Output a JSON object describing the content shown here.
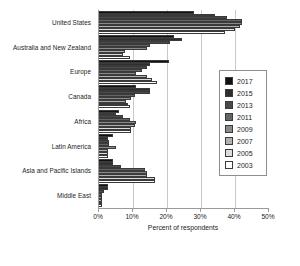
{
  "chart_data": {
    "type": "bar",
    "orientation": "horizontal",
    "title": "",
    "xlabel": "Percent of respondents",
    "ylabel": "",
    "xlim": [
      0,
      50
    ],
    "xticks": [
      "0%",
      "10%",
      "20%",
      "30%",
      "40%",
      "50%"
    ],
    "xtick_values": [
      0,
      10,
      20,
      30,
      40,
      50
    ],
    "grid": true,
    "legend_position": "right-inside",
    "categories": [
      "United States",
      "Australia and New Zealand",
      "Europe",
      "Canada",
      "Africa",
      "Latin America",
      "Asia and Pacific Islands",
      "Middle East"
    ],
    "series": [
      {
        "name": "2017",
        "color": "#111111",
        "values": [
          28,
          22,
          20.5,
          11,
          6,
          4,
          4,
          2.5
        ]
      },
      {
        "name": "2015",
        "color": "#2e2e2e",
        "values": [
          34,
          24.5,
          15,
          15,
          5,
          2.5,
          4,
          2.5
        ]
      },
      {
        "name": "2013",
        "color": "#494949",
        "values": [
          37.5,
          21,
          14,
          15,
          7,
          3,
          6.5,
          1.5
        ]
      },
      {
        "name": "2011",
        "color": "#646464",
        "values": [
          42,
          15,
          12.5,
          10.5,
          9,
          3,
          13.5,
          1
        ]
      },
      {
        "name": "2009",
        "color": "#8a8a8a",
        "values": [
          42,
          14,
          11,
          9.5,
          11,
          5,
          14,
          1
        ]
      },
      {
        "name": "2007",
        "color": "#b0b0b0",
        "values": [
          41.5,
          7.5,
          14,
          8,
          10.5,
          2.5,
          14,
          1
        ]
      },
      {
        "name": "2005",
        "color": "#dcdcdc",
        "values": [
          40,
          7,
          15.5,
          8.5,
          9.5,
          2.5,
          16.5,
          1
        ]
      },
      {
        "name": "2003",
        "color": "#ffffff",
        "values": [
          37,
          9,
          17,
          9,
          9.5,
          2.5,
          16.5,
          1
        ]
      }
    ]
  },
  "legend": {
    "items": [
      {
        "label": "2017"
      },
      {
        "label": "2015"
      },
      {
        "label": "2013"
      },
      {
        "label": "2011"
      },
      {
        "label": "2009"
      },
      {
        "label": "2007"
      },
      {
        "label": "2005"
      },
      {
        "label": "2003"
      }
    ]
  }
}
